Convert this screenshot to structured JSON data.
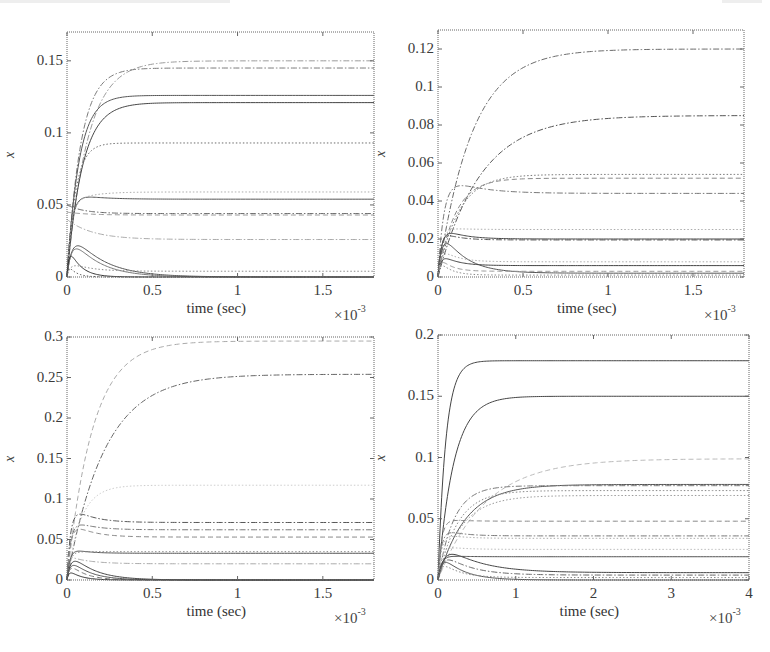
{
  "chart_data": [
    {
      "id": "top-left",
      "type": "line",
      "title": "",
      "xlabel": "time (sec)",
      "ylabel": "x",
      "x_multiplier": "×10",
      "x_multiplier_exp": "-3",
      "xlim": [
        0,
        1.8
      ],
      "ylim": [
        0,
        0.17
      ],
      "xticks": [
        0,
        0.5,
        1,
        1.5
      ],
      "xtick_labels": [
        "0",
        "0.5",
        "1",
        "1.5"
      ],
      "yticks": [
        0,
        0.05,
        0.1,
        0.15
      ],
      "ytick_labels": [
        "0",
        "0.05",
        "0.1",
        "0.15"
      ],
      "grid": false,
      "legend": null,
      "series": [
        {
          "name": "s1",
          "start": 0,
          "peak": null,
          "final": 0.15,
          "tau": 0.12,
          "style": "dashdot",
          "color": "#9a9a9a"
        },
        {
          "name": "s2",
          "start": 0,
          "peak": null,
          "final": 0.145,
          "tau": 0.08,
          "style": "dashdot",
          "color": "#7a7a7a"
        },
        {
          "name": "s3",
          "start": 0,
          "peak": null,
          "final": 0.126,
          "tau": 0.07,
          "style": "solid",
          "color": "#555555"
        },
        {
          "name": "s4",
          "start": 0,
          "peak": null,
          "final": 0.121,
          "tau": 0.09,
          "style": "solid",
          "color": "#444444"
        },
        {
          "name": "s5",
          "start": 0,
          "peak": null,
          "final": 0.093,
          "tau": 0.05,
          "style": "dotted",
          "color": "#6a6a6a"
        },
        {
          "name": "s6",
          "start": 0,
          "peak": 0.058,
          "final": 0.054,
          "tau": 0.06,
          "style": "solid",
          "color": "#555555"
        },
        {
          "name": "s7",
          "start": 0,
          "peak": 0.052,
          "final": 0.059,
          "tau": 0.05,
          "style": "dotted",
          "color": "#aaaaaa"
        },
        {
          "name": "s8",
          "start": 0.05,
          "peak": null,
          "final": 0.044,
          "tau": 0.1,
          "style": "dashdot",
          "color": "#666666"
        },
        {
          "name": "s9",
          "start": 0.045,
          "peak": null,
          "final": 0.043,
          "tau": 0.12,
          "style": "dashed",
          "color": "#999999"
        },
        {
          "name": "s10",
          "start": 0.04,
          "peak": null,
          "final": 0.026,
          "tau": 0.15,
          "style": "dashdot",
          "color": "#aaaaaa"
        },
        {
          "name": "s11",
          "start": 0,
          "peak": 0.03,
          "final": 0.0,
          "tau": 0.08,
          "style": "solid",
          "color": "#555555"
        },
        {
          "name": "s12",
          "start": 0,
          "peak": 0.027,
          "final": 0.0,
          "tau": 0.07,
          "style": "solid",
          "color": "#777777"
        },
        {
          "name": "s13",
          "start": 0,
          "peak": 0.02,
          "final": 0.0,
          "tau": 0.03,
          "style": "solid",
          "color": "#333333"
        },
        {
          "name": "s14",
          "start": 0,
          "peak": 0.01,
          "final": 0.004,
          "tau": 0.05,
          "style": "dotted",
          "color": "#888888"
        },
        {
          "name": "s15",
          "start": 0,
          "peak": 0.008,
          "final": 0.0,
          "tau": 0.02,
          "style": "dotted",
          "color": "#555555"
        }
      ]
    },
    {
      "id": "top-right",
      "type": "line",
      "title": "",
      "xlabel": "time (sec)",
      "ylabel": "x",
      "x_multiplier": "×10",
      "x_multiplier_exp": "-3",
      "xlim": [
        0,
        1.8
      ],
      "ylim": [
        0,
        0.13
      ],
      "xticks": [
        0,
        0.5,
        1,
        1.5
      ],
      "xtick_labels": [
        "0",
        "0.5",
        "1",
        "1.5"
      ],
      "yticks": [
        0,
        0.02,
        0.04,
        0.06,
        0.08,
        0.1,
        0.12
      ],
      "ytick_labels": [
        "0",
        "0.02",
        "0.04",
        "0.06",
        "0.08",
        "0.1",
        "0.12"
      ],
      "grid": false,
      "legend": null,
      "series": [
        {
          "name": "s1",
          "start": 0,
          "peak": null,
          "final": 0.12,
          "tau": 0.2,
          "style": "dashdot",
          "color": "#6a6a6a"
        },
        {
          "name": "s2",
          "start": 0,
          "peak": null,
          "final": 0.085,
          "tau": 0.25,
          "style": "dashdot",
          "color": "#555555"
        },
        {
          "name": "s3",
          "start": 0,
          "peak": null,
          "final": 0.054,
          "tau": 0.12,
          "style": "dotted",
          "color": "#777777"
        },
        {
          "name": "s4",
          "start": 0,
          "peak": null,
          "final": 0.052,
          "tau": 0.1,
          "style": "dashed",
          "color": "#888888"
        },
        {
          "name": "s5",
          "start": 0,
          "peak": 0.053,
          "final": 0.044,
          "tau": 0.08,
          "style": "dashdot",
          "color": "#777777"
        },
        {
          "name": "s6",
          "start": 0,
          "peak": 0.026,
          "final": 0.025,
          "tau": 0.05,
          "style": "dotted",
          "color": "#aaaaaa"
        },
        {
          "name": "s7",
          "start": 0,
          "peak": 0.026,
          "final": 0.02,
          "tau": 0.05,
          "style": "solid",
          "color": "#444444"
        },
        {
          "name": "s8",
          "start": 0,
          "peak": 0.024,
          "final": 0.0195,
          "tau": 0.04,
          "style": "dashdot",
          "color": "#555555"
        },
        {
          "name": "s9",
          "start": 0,
          "peak": 0.024,
          "final": 0.002,
          "tau": 0.06,
          "style": "solid",
          "color": "#555555"
        },
        {
          "name": "s10",
          "start": 0,
          "peak": 0.012,
          "final": 0.006,
          "tau": 0.04,
          "style": "solid",
          "color": "#444444"
        },
        {
          "name": "s11",
          "start": 0,
          "peak": 0.015,
          "final": 0.008,
          "tau": 0.04,
          "style": "dotted",
          "color": "#aaaaaa"
        },
        {
          "name": "s12",
          "start": 0,
          "peak": 0.01,
          "final": 0.003,
          "tau": 0.03,
          "style": "dashed",
          "color": "#999999"
        },
        {
          "name": "s13",
          "start": 0,
          "peak": 0.008,
          "final": 0.001,
          "tau": 0.03,
          "style": "dotted",
          "color": "#888888"
        }
      ]
    },
    {
      "id": "bottom-left",
      "type": "line",
      "title": "",
      "xlabel": "time (sec)",
      "ylabel": "x",
      "x_multiplier": "×10",
      "x_multiplier_exp": "-3",
      "xlim": [
        0,
        1.8
      ],
      "ylim": [
        0,
        0.3
      ],
      "xticks": [
        0,
        0.5,
        1,
        1.5
      ],
      "xtick_labels": [
        "0",
        "0.5",
        "1",
        "1.5"
      ],
      "yticks": [
        0,
        0.05,
        0.1,
        0.15,
        0.2,
        0.25,
        0.3
      ],
      "ytick_labels": [
        "0",
        "0.05",
        "0.1",
        "0.15",
        "0.2",
        "0.25",
        "0.3"
      ],
      "grid": false,
      "legend": null,
      "series": [
        {
          "name": "s1",
          "start": 0,
          "peak": null,
          "final": 0.295,
          "tau": 0.15,
          "style": "dashed",
          "color": "#aaaaaa"
        },
        {
          "name": "s2",
          "start": 0,
          "peak": null,
          "final": 0.254,
          "tau": 0.22,
          "style": "dashdot",
          "color": "#666666"
        },
        {
          "name": "s3",
          "start": 0,
          "peak": null,
          "final": 0.117,
          "tau": 0.08,
          "style": "dotted",
          "color": "#cccccc"
        },
        {
          "name": "s4",
          "start": 0,
          "peak": 0.092,
          "final": 0.071,
          "tau": 0.05,
          "style": "dashdot",
          "color": "#555555"
        },
        {
          "name": "s5",
          "start": 0,
          "peak": 0.075,
          "final": 0.062,
          "tau": 0.05,
          "style": "dashdot",
          "color": "#777777"
        },
        {
          "name": "s6",
          "start": 0,
          "peak": 0.072,
          "final": 0.053,
          "tau": 0.05,
          "style": "dashed",
          "color": "#888888"
        },
        {
          "name": "s7",
          "start": 0,
          "peak": 0.039,
          "final": 0.033,
          "tau": 0.04,
          "style": "solid",
          "color": "#555555"
        },
        {
          "name": "s8",
          "start": 0,
          "peak": 0.035,
          "final": 0.035,
          "tau": 0.04,
          "style": "dotted",
          "color": "#888888"
        },
        {
          "name": "s9",
          "start": 0.03,
          "peak": null,
          "final": 0.02,
          "tau": 0.12,
          "style": "dashdot",
          "color": "#aaaaaa"
        },
        {
          "name": "s10",
          "start": 0,
          "peak": 0.032,
          "final": 0.0,
          "tau": 0.06,
          "style": "solid",
          "color": "#444444"
        },
        {
          "name": "s11",
          "start": 0,
          "peak": 0.025,
          "final": 0.0,
          "tau": 0.05,
          "style": "solid",
          "color": "#555555"
        },
        {
          "name": "s12",
          "start": 0,
          "peak": 0.02,
          "final": 0.0,
          "tau": 0.04,
          "style": "dashed",
          "color": "#777777"
        },
        {
          "name": "s13",
          "start": 0,
          "peak": 0.012,
          "final": 0.0,
          "tau": 0.03,
          "style": "solid",
          "color": "#333333"
        }
      ]
    },
    {
      "id": "bottom-right",
      "type": "line",
      "title": "",
      "xlabel": "time (sec)",
      "ylabel": "x",
      "x_multiplier": "×10",
      "x_multiplier_exp": "-3",
      "xlim": [
        0,
        4
      ],
      "ylim": [
        0,
        0.2
      ],
      "xticks": [
        0,
        1,
        2,
        3,
        4
      ],
      "xtick_labels": [
        "0",
        "1",
        "2",
        "3",
        "4"
      ],
      "yticks": [
        0,
        0.05,
        0.1,
        0.15,
        0.2
      ],
      "ytick_labels": [
        "0",
        "0.05",
        "0.1",
        "0.15",
        "0.2"
      ],
      "grid": false,
      "legend": null,
      "series": [
        {
          "name": "s1",
          "start": 0,
          "peak": null,
          "final": 0.179,
          "tau": 0.1,
          "style": "solid",
          "color": "#444444"
        },
        {
          "name": "s2",
          "start": 0,
          "peak": null,
          "final": 0.15,
          "tau": 0.2,
          "style": "solid",
          "color": "#444444"
        },
        {
          "name": "s3",
          "start": 0,
          "peak": null,
          "final": 0.099,
          "tau": 0.6,
          "style": "dashed",
          "color": "#bbbbbb"
        },
        {
          "name": "s4",
          "start": 0,
          "peak": null,
          "final": 0.078,
          "tau": 0.35,
          "style": "solid",
          "color": "#555555"
        },
        {
          "name": "s5",
          "start": 0,
          "peak": null,
          "final": 0.077,
          "tau": 0.2,
          "style": "dashdot",
          "color": "#777777"
        },
        {
          "name": "s6",
          "start": 0,
          "peak": null,
          "final": 0.073,
          "tau": 0.25,
          "style": "dotted",
          "color": "#888888"
        },
        {
          "name": "s7",
          "start": 0,
          "peak": null,
          "final": 0.069,
          "tau": 0.3,
          "style": "dotted",
          "color": "#999999"
        },
        {
          "name": "s8",
          "start": 0,
          "peak": 0.05,
          "final": 0.048,
          "tau": 0.1,
          "style": "dashed",
          "color": "#888888"
        },
        {
          "name": "s9",
          "start": 0,
          "peak": 0.042,
          "final": 0.036,
          "tau": 0.1,
          "style": "dashdot",
          "color": "#777777"
        },
        {
          "name": "s10",
          "start": 0,
          "peak": 0.038,
          "final": 0.034,
          "tau": 0.1,
          "style": "dotted",
          "color": "#aaaaaa"
        },
        {
          "name": "s11",
          "start": 0,
          "peak": 0.028,
          "final": 0.025,
          "tau": 0.1,
          "style": "dotted",
          "color": "#bbbbbb"
        },
        {
          "name": "s12",
          "start": 0,
          "peak": 0.02,
          "final": 0.019,
          "tau": 0.1,
          "style": "solid",
          "color": "#555555"
        },
        {
          "name": "s13",
          "start": 0,
          "peak": 0.028,
          "final": 0.006,
          "tau": 0.2,
          "style": "solid",
          "color": "#444444"
        },
        {
          "name": "s14",
          "start": 0,
          "peak": 0.022,
          "final": 0.004,
          "tau": 0.15,
          "style": "dashdot",
          "color": "#666666"
        },
        {
          "name": "s15",
          "start": 0,
          "peak": 0.02,
          "final": 0.0,
          "tau": 0.12,
          "style": "solid",
          "color": "#555555"
        },
        {
          "name": "s16",
          "start": 0,
          "peak": 0.015,
          "final": 0.002,
          "tau": 0.1,
          "style": "dotted",
          "color": "#888888"
        }
      ]
    }
  ],
  "layout": {
    "panels": [
      {
        "left": 67,
        "top": 32,
        "width": 307,
        "height": 245
      },
      {
        "left": 438,
        "top": 30,
        "width": 306,
        "height": 247
      },
      {
        "left": 67,
        "top": 337,
        "width": 307,
        "height": 243
      },
      {
        "left": 438,
        "top": 335,
        "width": 311,
        "height": 245
      }
    ]
  }
}
